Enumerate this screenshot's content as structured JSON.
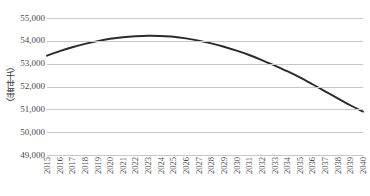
{
  "chart_data": {
    "type": "line",
    "title": "",
    "subtitle": "",
    "xlabel": "",
    "ylabel": "（千世帯）",
    "ylim": [
      49000,
      55000
    ],
    "y_ticks": [
      55000,
      54000,
      53000,
      52000,
      51000,
      50000,
      49000
    ],
    "y_tick_labels": [
      "55,000",
      "54,000",
      "53,000",
      "52,000",
      "51,000",
      "50,000",
      "49,000"
    ],
    "grid": true,
    "legend": false,
    "legend_position": "none",
    "line_color": "#2b2b2b",
    "categories": [
      "2015",
      "2016",
      "2017",
      "2018",
      "2019",
      "2020",
      "2021",
      "2022",
      "2023",
      "2024",
      "2025",
      "2026",
      "2027",
      "2028",
      "2029",
      "2030",
      "2031",
      "2032",
      "2033",
      "2034",
      "2035",
      "2036",
      "2037",
      "2038",
      "2039",
      "2040"
    ],
    "series": [
      {
        "name": "世帯数",
        "values": [
          53350,
          53550,
          53720,
          53870,
          53990,
          54090,
          54160,
          54200,
          54220,
          54210,
          54180,
          54110,
          54010,
          53890,
          53740,
          53570,
          53380,
          53160,
          52920,
          52670,
          52400,
          52100,
          51790,
          51480,
          51180,
          50900
        ]
      }
    ]
  }
}
